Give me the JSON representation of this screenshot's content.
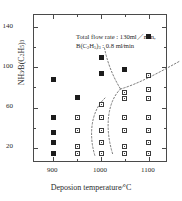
{
  "chart_data": {
    "type": "scatter",
    "title": "",
    "xlabel": "Deposion temperature/°C",
    "ylabel": "NH₃/B(C₂H₅)₃",
    "xlim": [
      860,
      1140
    ],
    "ylim": [
      5,
      152
    ],
    "xticks": [
      900,
      1000,
      1100
    ],
    "xticklabels": [
      "900",
      "1000",
      "1100"
    ],
    "xminorticks": [
      950,
      1050
    ],
    "yticks": [
      20,
      60,
      100,
      140
    ],
    "yticklabels": [
      "20",
      "60",
      "100",
      "140"
    ],
    "yminorticks": [
      40,
      80,
      120
    ],
    "grid": false,
    "legend": null,
    "annotations": [
      "Total flow rate : 130ml／min,",
      "B(C₂H₅)₃ : 0.8 ml／min"
    ],
    "series": [
      {
        "name": "filled-marker",
        "marker": "filled-square",
        "points": [
          {
            "x": 900,
            "y": 88
          },
          {
            "x": 900,
            "y": 50
          },
          {
            "x": 900,
            "y": 35
          },
          {
            "x": 900,
            "y": 25
          },
          {
            "x": 900,
            "y": 14
          },
          {
            "x": 950,
            "y": 70
          },
          {
            "x": 1000,
            "y": 110
          },
          {
            "x": 1000,
            "y": 94
          },
          {
            "x": 1050,
            "y": 98
          },
          {
            "x": 1100,
            "y": 131
          }
        ]
      },
      {
        "name": "open-marker",
        "marker": "open-square",
        "points": [
          {
            "x": 950,
            "y": 50
          },
          {
            "x": 950,
            "y": 37
          },
          {
            "x": 950,
            "y": 21
          },
          {
            "x": 950,
            "y": 14
          },
          {
            "x": 1000,
            "y": 63
          },
          {
            "x": 1000,
            "y": 50
          },
          {
            "x": 1000,
            "y": 37
          },
          {
            "x": 1000,
            "y": 25
          },
          {
            "x": 1000,
            "y": 14
          },
          {
            "x": 1050,
            "y": 75
          },
          {
            "x": 1050,
            "y": 69
          },
          {
            "x": 1050,
            "y": 50
          },
          {
            "x": 1050,
            "y": 37
          },
          {
            "x": 1050,
            "y": 21
          },
          {
            "x": 1050,
            "y": 14
          },
          {
            "x": 1100,
            "y": 92
          },
          {
            "x": 1100,
            "y": 78
          },
          {
            "x": 1100,
            "y": 69
          },
          {
            "x": 1100,
            "y": 50
          },
          {
            "x": 1100,
            "y": 37
          },
          {
            "x": 1100,
            "y": 25
          },
          {
            "x": 1100,
            "y": 14
          }
        ]
      }
    ],
    "curves": [
      {
        "name": "upper-left-boundary",
        "path": "M 70.5,33 C 73,46 78,60 86.5,74"
      },
      {
        "name": "upper-right-boundary",
        "path": "M 86.5,74 C 104,69 126,57 146,46"
      },
      {
        "name": "inner-c-boundary",
        "path": "M 86.5,74 C 74,86 70,112 79,140"
      },
      {
        "name": "outer-c-boundary",
        "path": "M 71,83 C 56,97 55,122 61,141"
      }
    ]
  }
}
